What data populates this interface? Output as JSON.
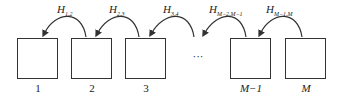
{
  "diagram": {
    "boxes": [
      {
        "label": "1"
      },
      {
        "label": "2"
      },
      {
        "label": "3"
      },
      {
        "label": "M−1"
      },
      {
        "label": "M"
      }
    ],
    "ellipsis": "···",
    "arrows": [
      {
        "symbol": "H",
        "sub": "1,2"
      },
      {
        "symbol": "H",
        "sub": "2,3"
      },
      {
        "symbol": "H",
        "sub": "3,4"
      },
      {
        "symbol": "H",
        "sub": "M−2,M−1"
      },
      {
        "symbol": "H",
        "sub": "M−1,M"
      }
    ]
  }
}
